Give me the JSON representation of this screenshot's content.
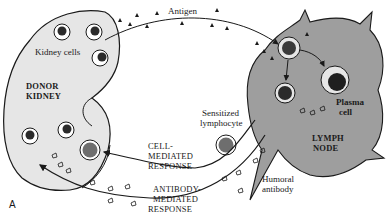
{
  "diagram": {
    "panel_letter": "A",
    "labels": {
      "antigen": "Antigen",
      "kidney_cells": "Kidney cells",
      "donor_kidney_line1": "DONOR",
      "donor_kidney_line2": "KIDNEY",
      "plasma_cell_line1": "Plasma",
      "plasma_cell_line2": "cell",
      "lymph_node_line1": "LYMPH",
      "lymph_node_line2": "NODE",
      "sensitized_line1": "Sensitized",
      "sensitized_line2": "lymphocyte",
      "cell_mediated_line1": "CELL-",
      "cell_mediated_line2": "MEDIATED",
      "cell_mediated_line3": "RESPONSE",
      "antibody_mediated_line1": "ANTIBODY-",
      "antibody_mediated_line2": "MEDIATED",
      "antibody_mediated_line3": "RESPONSE",
      "humoral_line1": "Humoral",
      "humoral_line2": "antibody"
    },
    "colors": {
      "kidney_fill": "#e4e4e4",
      "lymph_node_fill": "#9c9c9c",
      "ink": "#1a1a1a",
      "nucleus": "#2b2b2b",
      "lymphocyte_nucleus": "#6e6e6e"
    }
  }
}
